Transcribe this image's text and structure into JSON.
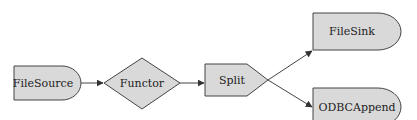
{
  "diagram": {
    "type": "flow",
    "colors": {
      "node_fill": "#d9d9d9",
      "stroke": "#444444",
      "text": "#222222"
    },
    "nodes": [
      {
        "id": "filesource",
        "label": "FileSource",
        "shape": "rounded-right-rect"
      },
      {
        "id": "functor",
        "label": "Functor",
        "shape": "diamond"
      },
      {
        "id": "split",
        "label": "Split",
        "shape": "pentagon-right"
      },
      {
        "id": "filesink",
        "label": "FileSink",
        "shape": "rounded-right-rect"
      },
      {
        "id": "odbcappend",
        "label": "ODBCAppend",
        "shape": "rounded-right-rect"
      }
    ],
    "edges": [
      {
        "from": "FileSource",
        "to": "Functor"
      },
      {
        "from": "Functor",
        "to": "Split"
      },
      {
        "from": "Split",
        "to": "FileSink"
      },
      {
        "from": "Split",
        "to": "ODBCAppend"
      }
    ]
  }
}
